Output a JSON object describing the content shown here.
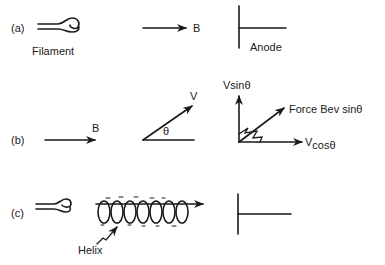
{
  "panels": {
    "a": {
      "label": "(a)",
      "filament_label": "Filament",
      "field_label": "B",
      "anode_label": "Anode"
    },
    "b": {
      "label": "(b)",
      "field_label": "B",
      "velocity_label": "V",
      "angle_label": "θ",
      "vsin_label": "Vsinθ",
      "force_label": "Force Bev sinθ",
      "vcos_prefix": "V",
      "vcos_suffix": "cosθ"
    },
    "c": {
      "label": "(c)",
      "helix_label": "Helix"
    }
  },
  "colors": {
    "ink": "#1a1a1a",
    "background": "#ffffff"
  }
}
